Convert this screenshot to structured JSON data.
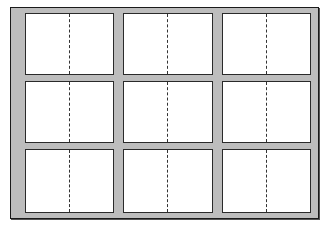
{
  "diagram": {
    "rows": 3,
    "columns": 3,
    "colors": {
      "frame_fill": "#bdbdbd",
      "frame_border": "#1a1a1a",
      "panel_fill": "#ffffff",
      "panel_border": "#2a2a2a",
      "fold_line": "#333333"
    },
    "panels": [
      {
        "row": 1,
        "col": 1,
        "x": 25,
        "y": 13,
        "w": 89,
        "h": 62
      },
      {
        "row": 1,
        "col": 2,
        "x": 123,
        "y": 13,
        "w": 90,
        "h": 62
      },
      {
        "row": 1,
        "col": 3,
        "x": 222,
        "y": 13,
        "w": 89,
        "h": 62
      },
      {
        "row": 2,
        "col": 1,
        "x": 25,
        "y": 81,
        "w": 89,
        "h": 62
      },
      {
        "row": 2,
        "col": 2,
        "x": 123,
        "y": 81,
        "w": 90,
        "h": 62
      },
      {
        "row": 2,
        "col": 3,
        "x": 222,
        "y": 81,
        "w": 89,
        "h": 62
      },
      {
        "row": 3,
        "col": 1,
        "x": 25,
        "y": 149,
        "w": 89,
        "h": 64
      },
      {
        "row": 3,
        "col": 2,
        "x": 123,
        "y": 149,
        "w": 90,
        "h": 64
      },
      {
        "row": 3,
        "col": 3,
        "x": 222,
        "y": 149,
        "w": 89,
        "h": 64
      }
    ]
  }
}
